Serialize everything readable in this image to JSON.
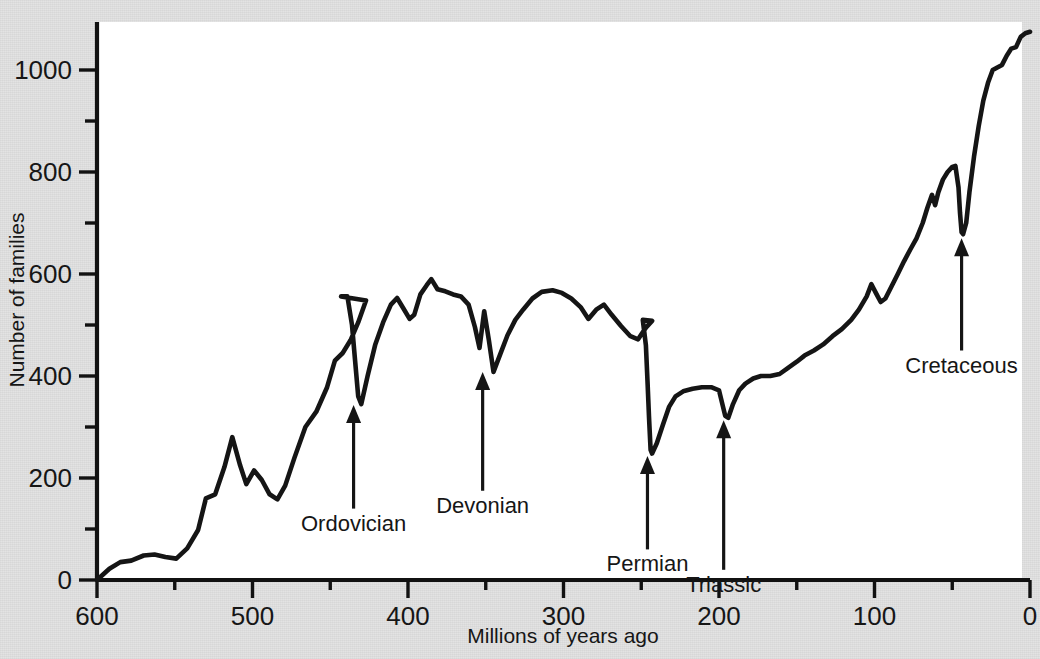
{
  "figure": {
    "background_color": "#e3e3e3",
    "plot_background_color": "#ffffff",
    "line_color": "#151515",
    "axis_color": "#111111"
  },
  "axes": {
    "x_title": "Millions of years ago",
    "y_title": "Number of families",
    "x_ticks": [
      "600",
      "500",
      "400",
      "300",
      "200",
      "100",
      "0"
    ],
    "y_ticks": [
      "0",
      "200",
      "400",
      "600",
      "800",
      "1000"
    ]
  },
  "annotations": [
    {
      "label": "Ordovician"
    },
    {
      "label": "Devonian"
    },
    {
      "label": "Permian"
    },
    {
      "label": "Triassic"
    },
    {
      "label": "Cretaceous"
    }
  ],
  "chart_data": {
    "type": "line",
    "title": "",
    "xlabel": "Millions of years ago",
    "ylabel": "Number of families",
    "xlim": [
      600,
      0
    ],
    "ylim": [
      0,
      1100
    ],
    "x_ticks": [
      600,
      500,
      400,
      300,
      200,
      100,
      0
    ],
    "y_ticks": [
      0,
      200,
      400,
      600,
      800,
      1000
    ],
    "x_minor_ticks": [
      550,
      450,
      350,
      250,
      150,
      50
    ],
    "y_minor_ticks": [
      100,
      300,
      500,
      700,
      900,
      1100
    ],
    "x_axis_inverted": true,
    "grid": false,
    "legend": null,
    "series": [
      {
        "name": "Number of marine animal families",
        "points": [
          [
            600,
            0
          ],
          [
            592,
            22
          ],
          [
            585,
            35
          ],
          [
            578,
            38
          ],
          [
            570,
            48
          ],
          [
            563,
            50
          ],
          [
            556,
            45
          ],
          [
            549,
            42
          ],
          [
            542,
            62
          ],
          [
            535,
            98
          ],
          [
            530,
            160
          ],
          [
            524,
            168
          ],
          [
            518,
            222
          ],
          [
            513,
            280
          ],
          [
            508,
            225
          ],
          [
            504,
            188
          ],
          [
            499,
            215
          ],
          [
            494,
            196
          ],
          [
            489,
            168
          ],
          [
            484,
            158
          ],
          [
            479,
            185
          ],
          [
            473,
            240
          ],
          [
            466,
            300
          ],
          [
            459,
            330
          ],
          [
            452,
            378
          ],
          [
            447,
            430
          ],
          [
            442,
            445
          ],
          [
            437,
            470
          ],
          [
            432,
            505
          ],
          [
            427,
            548
          ],
          [
            443,
            556
          ],
          [
            439,
            556
          ],
          [
            436,
            500
          ],
          [
            434,
            430
          ],
          [
            432,
            360
          ],
          [
            430,
            345
          ],
          [
            426,
            400
          ],
          [
            421,
            462
          ],
          [
            416,
            505
          ],
          [
            411,
            540
          ],
          [
            407,
            553
          ],
          [
            403,
            533
          ],
          [
            399,
            512
          ],
          [
            396,
            520
          ],
          [
            392,
            560
          ],
          [
            388,
            578
          ],
          [
            385,
            590
          ],
          [
            381,
            570
          ],
          [
            376,
            566
          ],
          [
            371,
            560
          ],
          [
            366,
            556
          ],
          [
            361,
            540
          ],
          [
            357,
            496
          ],
          [
            354,
            455
          ],
          [
            351,
            527
          ],
          [
            348,
            470
          ],
          [
            345,
            408
          ],
          [
            341,
            440
          ],
          [
            336,
            480
          ],
          [
            331,
            510
          ],
          [
            326,
            530
          ],
          [
            320,
            552
          ],
          [
            314,
            565
          ],
          [
            307,
            568
          ],
          [
            301,
            563
          ],
          [
            295,
            552
          ],
          [
            289,
            535
          ],
          [
            284,
            512
          ],
          [
            279,
            530
          ],
          [
            274,
            540
          ],
          [
            269,
            520
          ],
          [
            263,
            498
          ],
          [
            257,
            478
          ],
          [
            252,
            472
          ],
          [
            247,
            495
          ],
          [
            243,
            508
          ],
          [
            249,
            510
          ],
          [
            247,
            460
          ],
          [
            246,
            390
          ],
          [
            245,
            320
          ],
          [
            244,
            255
          ],
          [
            243,
            248
          ],
          [
            240,
            268
          ],
          [
            236,
            305
          ],
          [
            232,
            340
          ],
          [
            228,
            360
          ],
          [
            223,
            370
          ],
          [
            217,
            375
          ],
          [
            211,
            378
          ],
          [
            205,
            378
          ],
          [
            200,
            372
          ],
          [
            196,
            322
          ],
          [
            194,
            318
          ],
          [
            191,
            345
          ],
          [
            187,
            372
          ],
          [
            183,
            385
          ],
          [
            178,
            395
          ],
          [
            173,
            400
          ],
          [
            167,
            400
          ],
          [
            161,
            404
          ],
          [
            156,
            415
          ],
          [
            150,
            428
          ],
          [
            145,
            440
          ],
          [
            139,
            450
          ],
          [
            133,
            462
          ],
          [
            127,
            478
          ],
          [
            121,
            492
          ],
          [
            115,
            510
          ],
          [
            110,
            530
          ],
          [
            105,
            556
          ],
          [
            102,
            580
          ],
          [
            99,
            562
          ],
          [
            96,
            545
          ],
          [
            93,
            552
          ],
          [
            89,
            576
          ],
          [
            85,
            600
          ],
          [
            81,
            625
          ],
          [
            77,
            648
          ],
          [
            73,
            670
          ],
          [
            69,
            700
          ],
          [
            66,
            730
          ],
          [
            63,
            755
          ],
          [
            61,
            735
          ],
          [
            59,
            760
          ],
          [
            56,
            785
          ],
          [
            53,
            800
          ],
          [
            50,
            810
          ],
          [
            48,
            812
          ],
          [
            46,
            770
          ],
          [
            45,
            720
          ],
          [
            44,
            682
          ],
          [
            43,
            678
          ],
          [
            41,
            700
          ],
          [
            39,
            760
          ],
          [
            36,
            830
          ],
          [
            33,
            890
          ],
          [
            30,
            940
          ],
          [
            27,
            975
          ],
          [
            24,
            1000
          ],
          [
            21,
            1005
          ],
          [
            18,
            1010
          ],
          [
            15,
            1028
          ],
          [
            12,
            1042
          ],
          [
            9,
            1045
          ],
          [
            6,
            1065
          ],
          [
            3,
            1072
          ],
          [
            0,
            1075
          ]
        ]
      }
    ],
    "annotations": [
      {
        "label": "Ordovician",
        "x": 435,
        "y": 345,
        "label_x": 405,
        "label_y": 140
      },
      {
        "label": "Devonian",
        "x": 352,
        "y": 410,
        "label_x": 330,
        "label_y": 175
      },
      {
        "label": "Permian",
        "x": 246,
        "y": 245,
        "label_x": 258,
        "label_y": 60
      },
      {
        "label": "Triassic",
        "x": 197,
        "y": 315,
        "label_x": 178,
        "label_y": 20
      },
      {
        "label": "Cretaceous",
        "x": 44,
        "y": 672,
        "label_x": 70,
        "label_y": 450
      }
    ]
  }
}
